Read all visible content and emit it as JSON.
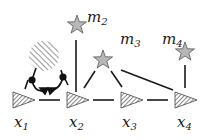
{
  "diagram": {
    "nodes": [
      {
        "id": "x1",
        "label": "x",
        "sub": "1",
        "shape": "triangle"
      },
      {
        "id": "x2",
        "label": "x",
        "sub": "2",
        "shape": "triangle"
      },
      {
        "id": "x3",
        "label": "x",
        "sub": "3",
        "shape": "triangle"
      },
      {
        "id": "x4",
        "label": "x",
        "sub": "4",
        "shape": "triangle"
      },
      {
        "id": "m2",
        "label": "m",
        "sub": "2",
        "shape": "star"
      },
      {
        "id": "m3",
        "label": "m",
        "sub": "3",
        "shape": "star"
      },
      {
        "id": "m4",
        "label": "m",
        "sub": "4",
        "shape": "star"
      }
    ],
    "edges": [
      [
        "x1",
        "x2"
      ],
      [
        "x2",
        "x3"
      ],
      [
        "x3",
        "x4"
      ],
      [
        "m2",
        "x2"
      ],
      [
        "m3",
        "x2"
      ],
      [
        "m3",
        "x3"
      ],
      [
        "m3",
        "x4"
      ],
      [
        "m4",
        "x4"
      ]
    ],
    "obstacle": {
      "shape": "hatched-circle"
    },
    "colors": {
      "star_fill": "#b8b8b8",
      "line": "#1a1a1a",
      "triangle_fill": "#6a6a6a"
    }
  }
}
